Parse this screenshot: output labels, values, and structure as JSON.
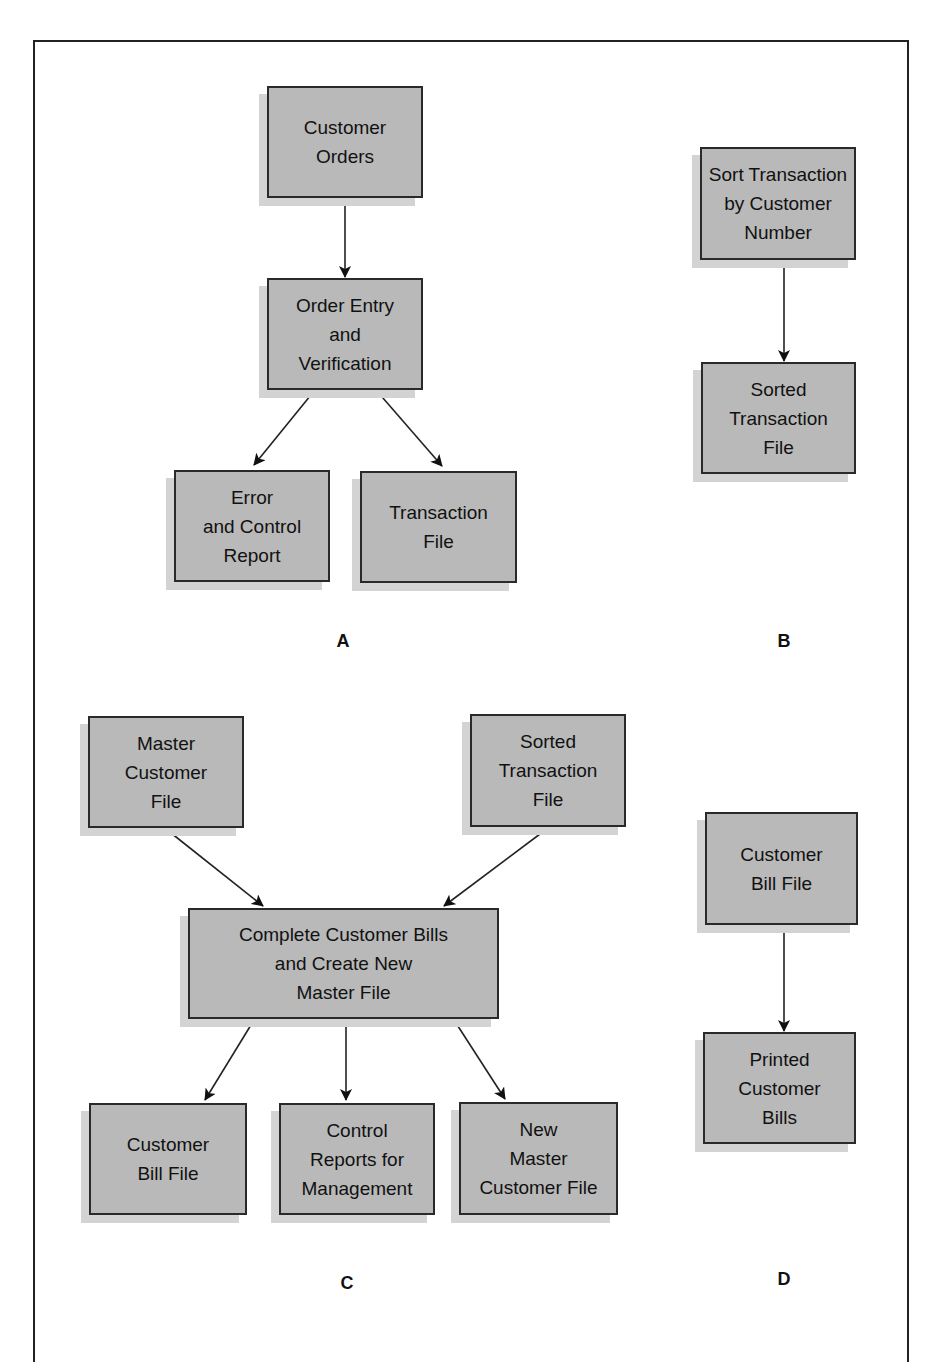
{
  "diagram": {
    "panels": {
      "A": {
        "label": "A",
        "boxes": {
          "customer_orders": "Customer\nOrders",
          "order_entry": "Order Entry\nand\nVerification",
          "error_report": "Error\nand Control\nReport",
          "transaction_file": "Transaction\nFile"
        }
      },
      "B": {
        "label": "B",
        "boxes": {
          "sort_transaction": "Sort  Transaction\nby Customer\nNumber",
          "sorted_transaction_file": "Sorted\nTransaction\nFile"
        }
      },
      "C": {
        "label": "C",
        "boxes": {
          "master_customer_file": "Master\nCustomer\nFile",
          "sorted_transaction_file": "Sorted\nTransaction\nFile",
          "complete_bills": "Complete Customer Bills\nand Create New\nMaster File",
          "customer_bill_file": "Customer\nBill File",
          "control_reports": "Control\nReports for\nManagement",
          "new_master_file": "New\nMaster\nCustomer File"
        }
      },
      "D": {
        "label": "D",
        "boxes": {
          "customer_bill_file": "Customer\nBill File",
          "printed_bills": "Printed\nCustomer\nBills"
        }
      }
    },
    "edges": [
      {
        "from": "A.customer_orders",
        "to": "A.order_entry"
      },
      {
        "from": "A.order_entry",
        "to": "A.error_report"
      },
      {
        "from": "A.order_entry",
        "to": "A.transaction_file"
      },
      {
        "from": "B.sort_transaction",
        "to": "B.sorted_transaction_file"
      },
      {
        "from": "C.master_customer_file",
        "to": "C.complete_bills"
      },
      {
        "from": "C.sorted_transaction_file",
        "to": "C.complete_bills"
      },
      {
        "from": "C.complete_bills",
        "to": "C.customer_bill_file"
      },
      {
        "from": "C.complete_bills",
        "to": "C.control_reports"
      },
      {
        "from": "C.complete_bills",
        "to": "C.new_master_file"
      },
      {
        "from": "D.customer_bill_file",
        "to": "D.printed_bills"
      }
    ],
    "colors": {
      "box_fill": "#b9b9b9",
      "box_shadow": "#d3d3d3",
      "stroke": "#222222"
    }
  }
}
